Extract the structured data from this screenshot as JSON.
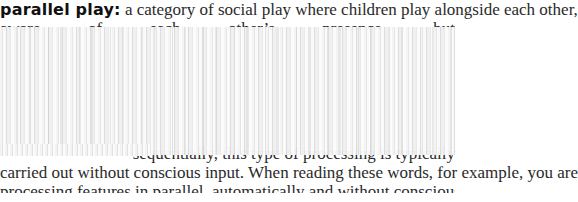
{
  "document": {
    "entry": {
      "term": "parallel play:",
      "definition_line1": " a category of social play where children play alongside each other,",
      "definition_line2": "aware of each other’s presence, but"
    },
    "lower_text": {
      "line3": "sequentially, this type of processing is typically",
      "line4": "carried out without conscious input. When reading these words, for example, you are",
      "line5": "processing features in parallel, automatically and without conscious effort. However,"
    },
    "obscured_region": {
      "description": "vertically streaked blank/redacted band covering middle of page"
    },
    "colors": {
      "text": "#2a2a2a",
      "term": "#111111",
      "background": "#ffffff",
      "obscured": "#f0f0f0"
    }
  }
}
